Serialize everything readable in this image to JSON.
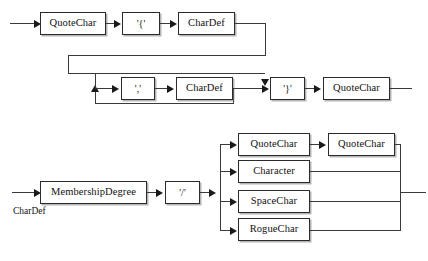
{
  "diagram": {
    "background_color": "#ffffff",
    "line_color": "#3a3a3a",
    "box_border_color": "#2b2b2b",
    "text_color": "#111111",
    "caption": "CharDef"
  },
  "rules": [
    {
      "name": "set-rule",
      "nodes": {
        "quotechar_open": "QuoteChar",
        "brace_open": "'{'",
        "chardef_first": "CharDef",
        "comma": "','",
        "chardef_repeat": "CharDef",
        "brace_close": "'}'",
        "quotechar_close": "QuoteChar"
      }
    },
    {
      "name": "chardef-rule",
      "nodes": {
        "membership_degree": "MembershipDegree",
        "slash": "'/'",
        "branch_quotechar": "QuoteChar",
        "branch_quotechar_second": "QuoteChar",
        "branch_character": "Character",
        "branch_spacechar": "SpaceChar",
        "branch_roguechar": "RogueChar"
      }
    }
  ]
}
